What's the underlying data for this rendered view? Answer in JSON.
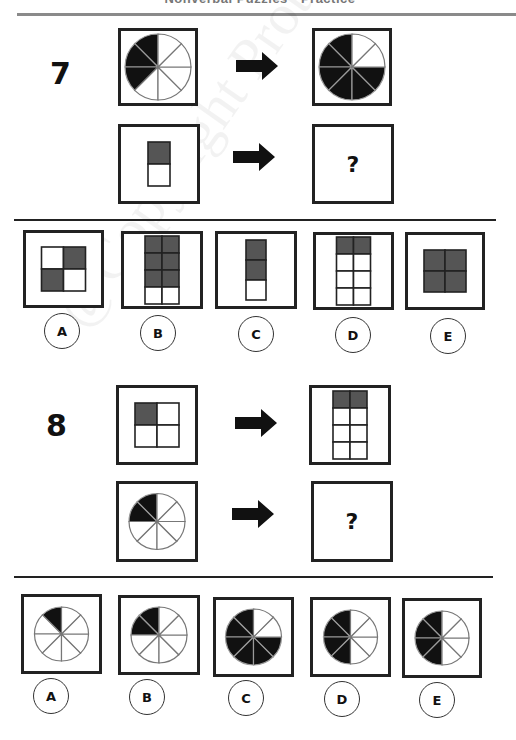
{
  "page": {
    "header_text": "Nonverbal Puzzles - Practice",
    "watermark": "@Copyright Protected"
  },
  "colors": {
    "fill_dark": "#111111",
    "fill_gray": "#555555",
    "line": "#222222",
    "rule": "#8a8a8a"
  },
  "questions": [
    {
      "number": "7",
      "row1": {
        "left": {
          "type": "pie",
          "dark_slices": [
            0,
            1,
            2
          ]
        },
        "arrow": "right-arrow",
        "right": {
          "type": "pie",
          "dark_slices": [
            0,
            1,
            2,
            3,
            4,
            5
          ]
        }
      },
      "row2": {
        "left": {
          "type": "grid",
          "cols": 1,
          "rows": 2,
          "dark": [
            0
          ]
        },
        "arrow": "right-arrow",
        "right": {
          "type": "question",
          "label": "?"
        }
      },
      "options": [
        {
          "label": "A",
          "figure": {
            "type": "grid",
            "cols": 2,
            "rows": 2,
            "dark": [
              1,
              2
            ]
          }
        },
        {
          "label": "B",
          "figure": {
            "type": "grid",
            "cols": 2,
            "rows": 4,
            "dark": [
              0,
              1,
              2,
              3,
              4,
              5
            ]
          }
        },
        {
          "label": "C",
          "figure": {
            "type": "grid",
            "cols": 1,
            "rows": 3,
            "dark": [
              0,
              1
            ]
          }
        },
        {
          "label": "D",
          "figure": {
            "type": "grid",
            "cols": 2,
            "rows": 4,
            "dark": [
              0,
              1
            ]
          }
        },
        {
          "label": "E",
          "figure": {
            "type": "grid",
            "cols": 2,
            "rows": 2,
            "dark": [
              0,
              1,
              2,
              3
            ]
          }
        }
      ]
    },
    {
      "number": "8",
      "row1": {
        "left": {
          "type": "grid",
          "cols": 2,
          "rows": 2,
          "dark": [
            0
          ]
        },
        "arrow": "right-arrow",
        "right": {
          "type": "grid",
          "cols": 2,
          "rows": 4,
          "dark": [
            0,
            1
          ]
        }
      },
      "row2": {
        "left": {
          "type": "pie",
          "dark_slices": [
            0,
            1
          ]
        },
        "arrow": "right-arrow",
        "right": {
          "type": "question",
          "label": "?"
        }
      },
      "options": [
        {
          "label": "A",
          "figure": {
            "type": "pie",
            "dark_slices": [
              0
            ]
          }
        },
        {
          "label": "B",
          "figure": {
            "type": "pie",
            "dark_slices": [
              0,
              1
            ]
          }
        },
        {
          "label": "C",
          "figure": {
            "type": "pie",
            "dark_slices": [
              0,
              1,
              2,
              3,
              4,
              5
            ]
          }
        },
        {
          "label": "D",
          "figure": {
            "type": "pie",
            "dark_slices": [
              0,
              1,
              2,
              3
            ]
          }
        },
        {
          "label": "E",
          "figure": {
            "type": "pie",
            "dark_slices": [
              0,
              1,
              2,
              3
            ]
          }
        }
      ]
    }
  ]
}
